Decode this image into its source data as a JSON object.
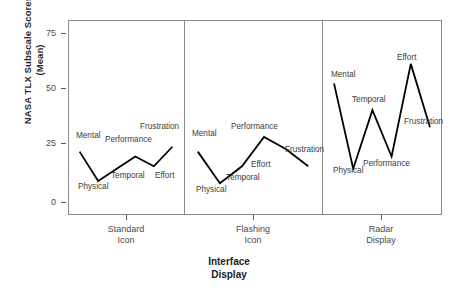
{
  "chart_data": {
    "type": "line",
    "title": "",
    "subtitle": "",
    "xlabel": "Interface Display",
    "xlabel_lines": [
      "Interface",
      "Display"
    ],
    "ylabel": "NASA TLX Subscale Scores (Mean)",
    "ylabel_lines": [
      "NASA TLX Subscale Scores",
      "(Mean)"
    ],
    "ylim": [
      0,
      80
    ],
    "yticks": [
      0,
      25,
      50,
      75
    ],
    "ytick_labels": [
      "0",
      "25",
      "50",
      "75"
    ],
    "grid": false,
    "legend": "none",
    "panel_layout": "trellis-horizontal",
    "categories": [
      "Mental",
      "Physical",
      "Temporal",
      "Performance",
      "Effort",
      "Frustration"
    ],
    "panels": [
      {
        "name": "Standard Icon",
        "name_lines": [
          "Standard",
          "Icon"
        ],
        "values": [
          26,
          14,
          19,
          24,
          20,
          28
        ]
      },
      {
        "name": "Flashing Icon",
        "name_lines": [
          "Flashing",
          "Icon"
        ],
        "values": [
          26,
          13,
          20,
          32,
          27,
          20
        ]
      },
      {
        "name": "Radar Display",
        "name_lines": [
          "Radar",
          "Display"
        ],
        "values": [
          54,
          19,
          43,
          24,
          62,
          36
        ]
      }
    ],
    "series": [
      {
        "name": "Standard Icon",
        "values": [
          26,
          14,
          19,
          24,
          20,
          28
        ]
      },
      {
        "name": "Flashing Icon",
        "values": [
          26,
          13,
          20,
          32,
          27,
          20
        ]
      },
      {
        "name": "Radar Display",
        "values": [
          54,
          19,
          43,
          24,
          62,
          36
        ]
      }
    ],
    "line_color": "#000000",
    "frame_color": "#8a8a8a",
    "background_color": "#ffffff",
    "point_labels": [
      [
        {
          "text": "Mental",
          "x": 76,
          "y": 131,
          "anchor": "start"
        },
        {
          "text": "Physical",
          "x": 78,
          "y": 182,
          "anchor": "start"
        },
        {
          "text": "Temporal",
          "x": 111,
          "y": 171,
          "anchor": "start"
        },
        {
          "text": "Performance",
          "x": 105,
          "y": 135,
          "anchor": "start"
        },
        {
          "text": "Effort",
          "x": 155,
          "y": 171,
          "anchor": "start"
        },
        {
          "text": "Frustration",
          "x": 140,
          "y": 122,
          "anchor": "start"
        }
      ],
      [
        {
          "text": "Mental",
          "x": 192,
          "y": 129,
          "anchor": "start"
        },
        {
          "text": "Physical",
          "x": 196,
          "y": 185,
          "anchor": "start"
        },
        {
          "text": "Temporal",
          "x": 226,
          "y": 173,
          "anchor": "start"
        },
        {
          "text": "Performance",
          "x": 231,
          "y": 122,
          "anchor": "start"
        },
        {
          "text": "Effort",
          "x": 251,
          "y": 160,
          "anchor": "start"
        },
        {
          "text": "Frustration",
          "x": 285,
          "y": 145,
          "anchor": "start"
        }
      ],
      [
        {
          "text": "Mental",
          "x": 331,
          "y": 70,
          "anchor": "start"
        },
        {
          "text": "Physical",
          "x": 333,
          "y": 166,
          "anchor": "start"
        },
        {
          "text": "Temporal",
          "x": 352,
          "y": 95,
          "anchor": "start"
        },
        {
          "text": "Performance",
          "x": 363,
          "y": 159,
          "anchor": "start"
        },
        {
          "text": "Effort",
          "x": 397,
          "y": 53,
          "anchor": "start"
        },
        {
          "text": "Frustration",
          "x": 404,
          "y": 117,
          "anchor": "start"
        }
      ]
    ]
  }
}
